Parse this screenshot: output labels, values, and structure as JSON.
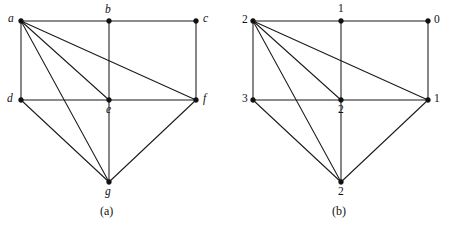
{
  "figure": {
    "background_color": "#ffffff",
    "line_color": "#1a1a1a",
    "width": 464,
    "height": 228,
    "panels": [
      {
        "id": "panel-a",
        "caption": "(a)",
        "caption_pos": {
          "x": 100,
          "y": 205
        },
        "label_style": "italic",
        "vertices": [
          {
            "id": "a",
            "label": "a",
            "x": 21,
            "y": 21,
            "lx": 8,
            "ly": 13
          },
          {
            "id": "b",
            "label": "b",
            "x": 109,
            "y": 21,
            "lx": 105,
            "ly": 4
          },
          {
            "id": "c",
            "label": "c",
            "x": 196,
            "y": 21,
            "lx": 203,
            "ly": 13
          },
          {
            "id": "d",
            "label": "d",
            "x": 21,
            "y": 100,
            "lx": 7,
            "ly": 93
          },
          {
            "id": "e",
            "label": "e",
            "x": 109,
            "y": 100,
            "lx": 106,
            "ly": 104
          },
          {
            "id": "f",
            "label": "f",
            "x": 196,
            "y": 100,
            "lx": 203,
            "ly": 93
          },
          {
            "id": "g",
            "label": "g",
            "x": 109,
            "y": 182,
            "lx": 105,
            "ly": 186
          }
        ],
        "edges": [
          [
            "a",
            "b"
          ],
          [
            "b",
            "c"
          ],
          [
            "a",
            "d"
          ],
          [
            "b",
            "e"
          ],
          [
            "c",
            "f"
          ],
          [
            "d",
            "e"
          ],
          [
            "e",
            "f"
          ],
          [
            "a",
            "f"
          ],
          [
            "a",
            "e"
          ],
          [
            "a",
            "g"
          ],
          [
            "d",
            "g"
          ],
          [
            "e",
            "g"
          ],
          [
            "f",
            "g"
          ]
        ]
      },
      {
        "id": "panel-b",
        "caption": "(b)",
        "caption_pos": {
          "x": 332,
          "y": 205
        },
        "label_style": "upright",
        "vertices": [
          {
            "id": "a",
            "label": "2",
            "x": 253,
            "y": 21,
            "lx": 242,
            "ly": 14
          },
          {
            "id": "b",
            "label": "1",
            "x": 341,
            "y": 21,
            "lx": 338,
            "ly": 3
          },
          {
            "id": "c",
            "label": "0",
            "x": 428,
            "y": 21,
            "lx": 434,
            "ly": 14
          },
          {
            "id": "d",
            "label": "3",
            "x": 253,
            "y": 100,
            "lx": 242,
            "ly": 93
          },
          {
            "id": "e",
            "label": "2",
            "x": 341,
            "y": 100,
            "lx": 338,
            "ly": 104
          },
          {
            "id": "f",
            "label": "1",
            "x": 428,
            "y": 100,
            "lx": 434,
            "ly": 93
          },
          {
            "id": "g",
            "label": "2",
            "x": 341,
            "y": 182,
            "lx": 338,
            "ly": 186
          }
        ],
        "edges": [
          [
            "a",
            "b"
          ],
          [
            "b",
            "c"
          ],
          [
            "a",
            "d"
          ],
          [
            "b",
            "e"
          ],
          [
            "c",
            "f"
          ],
          [
            "d",
            "e"
          ],
          [
            "e",
            "f"
          ],
          [
            "a",
            "f"
          ],
          [
            "a",
            "e"
          ],
          [
            "a",
            "g"
          ],
          [
            "d",
            "g"
          ],
          [
            "e",
            "g"
          ],
          [
            "f",
            "g"
          ]
        ]
      }
    ]
  },
  "chart_data": {
    "type": "diagram",
    "title": "",
    "panels": [
      {
        "name": "(a)",
        "vertex_labels": [
          "a",
          "b",
          "c",
          "d",
          "e",
          "f",
          "g"
        ],
        "edges": [
          "a-b",
          "b-c",
          "a-d",
          "b-e",
          "c-f",
          "d-e",
          "e-f",
          "a-f",
          "a-e",
          "a-g",
          "d-g",
          "e-g",
          "f-g"
        ],
        "degrees": {
          "a": 5,
          "b": 3,
          "c": 2,
          "d": 3,
          "e": 5,
          "f": 4,
          "g": 4
        }
      },
      {
        "name": "(b)",
        "vertex_labels": [
          "2",
          "1",
          "0",
          "3",
          "2",
          "1",
          "2"
        ],
        "edges": [
          "2(top-left)-1(top-mid)",
          "1(top-mid)-0(top-right)",
          "2(top-left)-3(mid-left)",
          "1(top-mid)-2(mid-mid)",
          "0(top-right)-1(mid-right)",
          "3(mid-left)-2(mid-mid)",
          "2(mid-mid)-1(mid-right)",
          "2(top-left)-1(mid-right)",
          "2(top-left)-2(mid-mid)",
          "2(top-left)-2(bottom)",
          "3(mid-left)-2(bottom)",
          "2(mid-mid)-2(bottom)",
          "1(mid-right)-2(bottom)"
        ]
      }
    ]
  }
}
